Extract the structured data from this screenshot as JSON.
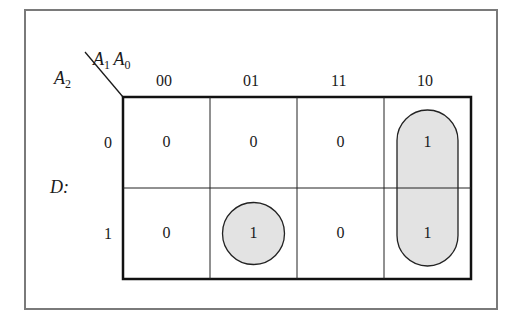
{
  "kmap": {
    "row_variable": {
      "name": "A",
      "sub": "2"
    },
    "col_variables": [
      {
        "name": "A",
        "sub": "1"
      },
      {
        "name": "A",
        "sub": "0"
      }
    ],
    "output_label": "D:",
    "column_headers": [
      "00",
      "01",
      "11",
      "10"
    ],
    "row_headers": [
      "0",
      "1"
    ],
    "cells": [
      [
        "0",
        "0",
        "0",
        "1"
      ],
      [
        "0",
        "1",
        "0",
        "1"
      ]
    ],
    "groupings": [
      {
        "type": "circle",
        "cells": [
          [
            1,
            1
          ]
        ],
        "fill": "#e3e3e3"
      },
      {
        "type": "pill",
        "cells": [
          [
            0,
            3
          ],
          [
            1,
            3
          ]
        ],
        "fill": "#e3e3e3"
      }
    ]
  }
}
